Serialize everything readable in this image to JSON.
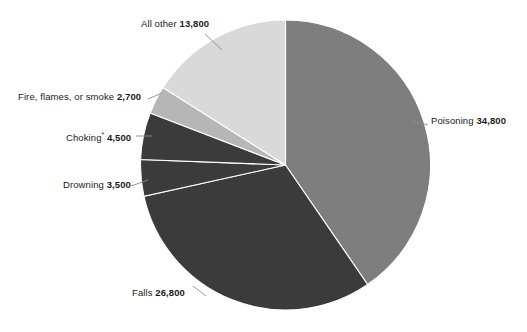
{
  "chart_data": {
    "type": "pie",
    "title": "",
    "subtitle": "",
    "xlabel": "",
    "ylabel": "",
    "legend_position": "none",
    "grid": false,
    "total": 86100,
    "start_angle_deg": 0,
    "direction": "clockwise",
    "categories": [
      "Poisoning",
      "Falls",
      "Drowning",
      "Choking",
      "Fire, flames, or smoke",
      "All other"
    ],
    "values": [
      34800,
      26800,
      3500,
      4500,
      2700,
      13800
    ],
    "slices": [
      {
        "name": "Poisoning",
        "label_name": "Poisoning",
        "value": 34800,
        "value_label": "34,800",
        "footnote_marker": "",
        "percent": 40.4,
        "angle_deg": 145.5,
        "color": "#7e7e7e",
        "label_side": "right"
      },
      {
        "name": "Falls",
        "label_name": "Falls",
        "value": 26800,
        "value_label": "26,800",
        "footnote_marker": "",
        "percent": 31.1,
        "angle_deg": 112.1,
        "color": "#3b3b3b",
        "label_side": "bottom-left"
      },
      {
        "name": "Drowning",
        "label_name": "Drowning",
        "value": 3500,
        "value_label": "3,500",
        "footnote_marker": "",
        "percent": 4.1,
        "angle_deg": 14.6,
        "color": "#3b3b3b",
        "label_side": "left"
      },
      {
        "name": "Choking",
        "label_name": "Choking",
        "value": 4500,
        "value_label": "4,500",
        "footnote_marker": "*",
        "percent": 5.2,
        "angle_deg": 18.8,
        "color": "#3b3b3b",
        "label_side": "left"
      },
      {
        "name": "Fire, flames, or smoke",
        "label_name": "Fire, flames, or smoke",
        "value": 2700,
        "value_label": "2,700",
        "footnote_marker": "",
        "percent": 3.1,
        "angle_deg": 11.3,
        "color": "#b6b6b6",
        "label_side": "left"
      },
      {
        "name": "All other",
        "label_name": "All other",
        "value": 13800,
        "value_label": "13,800",
        "footnote_marker": "",
        "percent": 16.0,
        "angle_deg": 57.7,
        "color": "#d9d9d9",
        "label_side": "top-left"
      }
    ]
  },
  "colors": {
    "background": "#ffffff",
    "text": "#1b1b1b",
    "leader_line": "#8c8c8c",
    "slice_separator": "#ffffff",
    "poisoning": "#7e7e7e",
    "falls": "#3b3b3b",
    "drowning": "#3b3b3b",
    "choking": "#3b3b3b",
    "fire": "#b6b6b6",
    "all_other": "#d9d9d9"
  }
}
